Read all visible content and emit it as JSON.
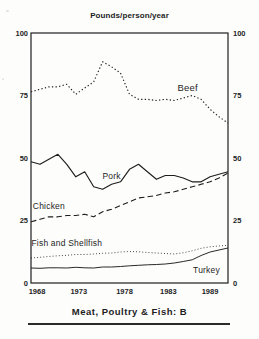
{
  "title": "Pounds/person/year",
  "caption": "Meat, Poultry & Fish: B",
  "colors": {
    "ink": "#1e1e1e",
    "background": "#fdfdfc"
  },
  "chart_data": {
    "type": "line",
    "title": "Pounds/person/year",
    "xlabel": "",
    "ylabel": "Pounds/person/year",
    "grid": false,
    "legend": "inline-labels",
    "xlim": [
      1968,
      1990
    ],
    "ylim": [
      0,
      100
    ],
    "x_ticks": [
      1968,
      1973,
      1978,
      1983,
      1989
    ],
    "x_tick_labels": [
      "1968",
      "1973",
      "1978",
      "1983",
      "1989"
    ],
    "y_ticks": [
      100,
      75,
      50,
      25,
      0
    ],
    "y_tick_sides": [
      "left",
      "right"
    ],
    "x": [
      1968,
      1969,
      1970,
      1971,
      1972,
      1973,
      1974,
      1975,
      1976,
      1977,
      1978,
      1979,
      1980,
      1981,
      1982,
      1983,
      1984,
      1985,
      1986,
      1987,
      1988,
      1989,
      1990
    ],
    "series": [
      {
        "name": "Beef",
        "style": "dotted",
        "values": [
          76.5,
          77.5,
          78.5,
          78.5,
          79.5,
          75.5,
          78,
          80.5,
          88.5,
          86.5,
          84,
          75.5,
          73.5,
          73.5,
          73,
          73.5,
          73,
          74,
          75,
          73.5,
          69.5,
          66.5,
          64
        ],
        "label_at": {
          "x": 1985.5,
          "y": 78
        }
      },
      {
        "name": "Pork",
        "style": "solid",
        "values": [
          48.5,
          47.5,
          49.5,
          51.5,
          47.5,
          42.5,
          44.5,
          38.5,
          37.5,
          39.5,
          40.5,
          45.5,
          47.5,
          44.5,
          41.5,
          43,
          43,
          42,
          40.5,
          40.5,
          42.5,
          43.5,
          44.5
        ],
        "label_at": {
          "x": 1977,
          "y": 43
        }
      },
      {
        "name": "Chicken",
        "style": "dashed",
        "values": [
          24.5,
          25.5,
          26.5,
          26.5,
          27,
          27,
          27.5,
          26.5,
          28.5,
          29.5,
          31,
          32.5,
          34,
          34.5,
          35,
          36,
          36.5,
          37.5,
          38.5,
          39.5,
          40.5,
          42,
          44
        ],
        "label_at": {
          "x": 1970,
          "y": 31
        }
      },
      {
        "name": "Fish and Shellfish",
        "style": "fine-dotted",
        "values": [
          10,
          10.3,
          10.6,
          10.9,
          11.1,
          11.4,
          11.4,
          11.6,
          11.9,
          12,
          12.4,
          12.6,
          12.5,
          12.2,
          12,
          11.8,
          11.6,
          12.1,
          12.9,
          13.9,
          14.5,
          14.8,
          15.1
        ],
        "label_at": {
          "x": 1972,
          "y": 16
        }
      },
      {
        "name": "Turkey",
        "style": "solid-thin",
        "values": [
          6,
          5.9,
          6.1,
          6.1,
          6,
          6.3,
          6.1,
          6,
          6.4,
          6.4,
          6.6,
          6.9,
          7.1,
          7.3,
          7.4,
          7.6,
          8,
          8.6,
          9.3,
          11,
          12.4,
          13.2,
          14
        ],
        "label_at": {
          "x": 1987.6,
          "y": 5.2
        }
      }
    ]
  }
}
